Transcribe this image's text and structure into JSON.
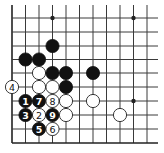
{
  "board": {
    "description": "Go board corner diagram with numbered move sequence 1-9",
    "grid": {
      "columns_x": [
        12,
        25.5,
        39,
        52.5,
        66,
        79.5,
        93,
        106.5,
        120,
        133.5,
        147
      ],
      "rows_y": [
        18,
        32,
        46,
        59.5,
        73,
        87,
        101,
        115,
        129,
        143
      ],
      "left_edge": true,
      "bottom_edge": true,
      "line_extend_top": 5,
      "line_extend_right": 158
    },
    "star_points": [
      {
        "col": 3,
        "row": 0
      },
      {
        "col": 9,
        "row": 0
      },
      {
        "col": 9,
        "row": 6
      }
    ],
    "stones": [
      {
        "color": "black",
        "col": 3,
        "row": 2,
        "label": ""
      },
      {
        "color": "black",
        "col": 1,
        "row": 3,
        "label": ""
      },
      {
        "color": "black",
        "col": 2,
        "row": 3,
        "label": ""
      },
      {
        "color": "white",
        "col": 2,
        "row": 4,
        "label": ""
      },
      {
        "color": "black",
        "col": 3,
        "row": 4,
        "label": ""
      },
      {
        "color": "black",
        "col": 4,
        "row": 4,
        "label": ""
      },
      {
        "color": "black",
        "col": 6,
        "row": 4,
        "label": ""
      },
      {
        "color": "white",
        "col": 0,
        "row": 5,
        "label": "4"
      },
      {
        "color": "white",
        "col": 2,
        "row": 5,
        "label": ""
      },
      {
        "color": "white",
        "col": 3,
        "row": 5,
        "label": ""
      },
      {
        "color": "black",
        "col": 4,
        "row": 5,
        "label": ""
      },
      {
        "color": "black",
        "col": 1,
        "row": 6,
        "label": "1"
      },
      {
        "color": "black",
        "col": 2,
        "row": 6,
        "label": "7"
      },
      {
        "color": "white",
        "col": 3,
        "row": 6,
        "label": "8"
      },
      {
        "color": "white",
        "col": 4,
        "row": 6,
        "label": ""
      },
      {
        "color": "white",
        "col": 6,
        "row": 6,
        "label": ""
      },
      {
        "color": "black",
        "col": 1,
        "row": 7,
        "label": "3"
      },
      {
        "color": "white",
        "col": 2,
        "row": 7,
        "label": "2"
      },
      {
        "color": "black",
        "col": 3,
        "row": 7,
        "label": "9"
      },
      {
        "color": "white",
        "col": 4,
        "row": 7,
        "label": ""
      },
      {
        "color": "white",
        "col": 8,
        "row": 7,
        "label": ""
      },
      {
        "color": "black",
        "col": 2,
        "row": 8,
        "label": "5"
      },
      {
        "color": "white",
        "col": 3,
        "row": 8,
        "label": "6"
      }
    ],
    "stone_radius": 6.6
  }
}
